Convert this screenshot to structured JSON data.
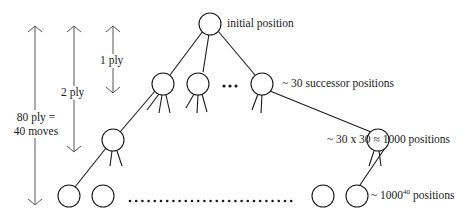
{
  "depth_labels": {
    "one_ply": "1 ply",
    "two_ply": "2 ply",
    "full_game_line1": "80 ply =",
    "full_game_line2": "40 moves"
  },
  "level_labels": {
    "root": "initial position",
    "level1": "~ 30 successor positions",
    "level2": "~ 30 x 30 ≈ 1000 positions",
    "leaves_prefix": "~ 1000",
    "leaves_exponent": "40",
    "leaves_suffix": " positions"
  },
  "ellipsis": {
    "level1": "•••"
  },
  "colors": {
    "stroke": "#1a1a1a",
    "arrow": "#555555",
    "background": "#ffffff"
  }
}
